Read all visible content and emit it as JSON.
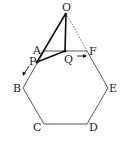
{
  "diagram": {
    "type": "geometry",
    "labels": {
      "O": "O",
      "A": "A",
      "B": "B",
      "C": "C",
      "D": "D",
      "E": "E",
      "F": "F",
      "P": "P",
      "Q": "Q"
    },
    "colors": {
      "stroke": "#333333",
      "bold": "#111111",
      "dashed": "#555555"
    }
  }
}
